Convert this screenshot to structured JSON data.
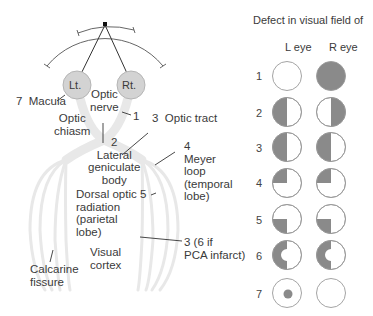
{
  "figure": {
    "eyes": {
      "left": "Lt.",
      "right": "Rt."
    },
    "labels": {
      "macula": "7  Macula",
      "optic_nerve": "Optic\nnerve",
      "optic_nerve_num": "1",
      "optic_chiasm": "Optic\nchiasm",
      "optic_tract": "3  Optic tract",
      "lgb": "2\nLateral\ngeniculate\nbody",
      "meyer": "4\nMeyer\nloop\n(temporal\nlobe)",
      "dorsal": "Dorsal optic 5\nradiation\n(parietal\nlobe)",
      "visual_cortex": "Visual\ncortex",
      "calcarine": "Calcarine\nfissure",
      "pca": "3 (6 if\nPCA infarct)"
    }
  },
  "defects": {
    "title": "Defect in visual field of",
    "col_left": "L eye",
    "col_right": "R eye",
    "rows": [
      {
        "num": "1",
        "left": "none",
        "right": "full"
      },
      {
        "num": "2",
        "left": "left-half",
        "right": "right-half"
      },
      {
        "num": "3",
        "left": "left-half",
        "right": "left-half"
      },
      {
        "num": "4",
        "left": "upper-left-quadrant",
        "right": "upper-left-quadrant"
      },
      {
        "num": "5",
        "left": "lower-left-quadrant",
        "right": "lower-left-quadrant"
      },
      {
        "num": "6",
        "left": "left-half-macular-sparing",
        "right": "left-half-macular-sparing"
      },
      {
        "num": "7",
        "left": "central-scotoma",
        "right": "none"
      }
    ]
  },
  "colors": {
    "defect_fill": "#8a8a8a",
    "circle_stroke": "#9a9a9a",
    "pathway": "#e9e9e9",
    "eye_fill": "#d3d3d3"
  }
}
